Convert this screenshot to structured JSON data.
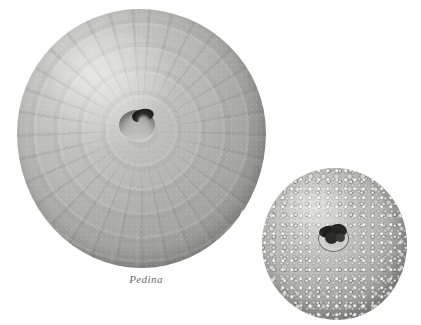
{
  "figure": {
    "background_color": "#ffffff",
    "width": 421,
    "height": 325,
    "medium": "grayscale photographic plate"
  },
  "specimens": [
    {
      "id": "pedina",
      "label": "Pedina",
      "label_style": "italic",
      "description": "large echinoid (sea urchin) fossil test, aboral view, smooth weathered surface with radial plate sutures and central apical depression",
      "position": "left",
      "relative_size": "large",
      "tone_color": "#a8a8a4",
      "shadow_color": "#6e6e6a",
      "features": [
        "apical-depression",
        "radial-plate-rays",
        "concentric-banding",
        "chipped-margin-notch",
        "granular-stone-grain"
      ]
    },
    {
      "id": "small-urchin",
      "label": "",
      "description": "smaller echinoid test covered in dense rounded tubercles with dark irregular central peristome opening; cropped at lower edge of plate",
      "position": "lower-right",
      "relative_size": "small",
      "tone_color": "#b0b0ac",
      "shadow_color": "#73736f",
      "features": [
        "dense-tubercles",
        "coarse-marginal-tubercles",
        "dark-peristome",
        "cropped-bottom-edge"
      ]
    }
  ],
  "caption": {
    "text": "Pedina"
  }
}
